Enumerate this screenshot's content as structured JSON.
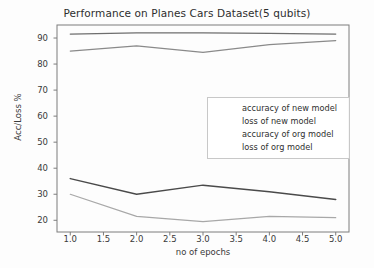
{
  "chart_data": {
    "type": "line",
    "title": "Performance on Planes Cars Dataset(5 qubits)",
    "xlabel": "no of epochs",
    "ylabel": "Acc/Loss %",
    "x": [
      1.0,
      2.0,
      3.0,
      4.0,
      5.0
    ],
    "xlim": [
      0.8,
      5.2
    ],
    "ylim": [
      15.5,
      95.0
    ],
    "xticks": [
      "1.0",
      "1.5",
      "2.0",
      "2.5",
      "3.0",
      "3.5",
      "4.0",
      "4.5",
      "5.0"
    ],
    "xtick_values": [
      1.0,
      1.5,
      2.0,
      2.5,
      3.0,
      3.5,
      4.0,
      4.5,
      5.0
    ],
    "yticks": [
      "20",
      "30",
      "40",
      "50",
      "60",
      "70",
      "80",
      "90"
    ],
    "ytick_values": [
      20,
      30,
      40,
      50,
      60,
      70,
      80,
      90
    ],
    "grid": false,
    "legend_position": "center-right",
    "series": [
      {
        "name": "accuracy of new model",
        "values": [
          91.5,
          92.0,
          92.0,
          91.8,
          91.5
        ],
        "color": "#6e6e6e",
        "width": 1.3
      },
      {
        "name": "loss of new model",
        "values": [
          30.0,
          21.5,
          19.5,
          21.5,
          21.0
        ],
        "color": "#a8a8a8",
        "width": 1.2
      },
      {
        "name": "accuracy of org model",
        "values": [
          85.0,
          87.0,
          84.5,
          87.5,
          89.0
        ],
        "color": "#8a8a8a",
        "width": 1.2
      },
      {
        "name": "loss of org model",
        "values": [
          36.0,
          30.0,
          33.5,
          31.0,
          28.0
        ],
        "color": "#4a4a4a",
        "width": 1.5
      }
    ]
  },
  "legend": {
    "items": [
      "accuracy of new model",
      "loss of new model",
      "accuracy of org model",
      "loss of org model"
    ]
  }
}
